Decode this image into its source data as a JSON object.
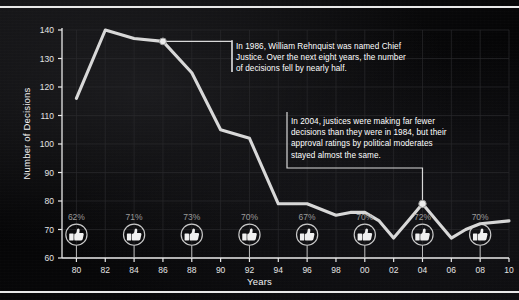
{
  "axes": {
    "ylabel": "Number of Decisions",
    "xlabel": "Years",
    "yticks": [
      "140",
      "130",
      "120",
      "110",
      "100",
      "90",
      "80",
      "70",
      "60"
    ],
    "xticks": [
      "80",
      "82",
      "84",
      "86",
      "88",
      "90",
      "92",
      "94",
      "96",
      "98",
      "00",
      "02",
      "04",
      "06",
      "08",
      "10"
    ]
  },
  "annotations": [
    {
      "name": "callout-1986",
      "text": "In 1986, William Rehnquist was named Chief\nJustice. Over the next eight years, the number\nof decisions fell by nearly half.",
      "marker_year": 1986,
      "marker_value": 136
    },
    {
      "name": "callout-2004",
      "text": "In 2004, justices were making far fewer\ndecisions than they were in 1984, but their\napproval ratings by political moderates\nstayed almost the same.",
      "marker_year": 2004,
      "marker_value": 79
    }
  ],
  "approval": [
    {
      "year": 1980,
      "label": "62%",
      "icon": "thumbs-up-icon"
    },
    {
      "year": 1984,
      "label": "71%",
      "icon": "thumbs-up-icon"
    },
    {
      "year": 1988,
      "label": "73%",
      "icon": "thumbs-up-icon"
    },
    {
      "year": 1992,
      "label": "70%",
      "icon": "thumbs-up-icon"
    },
    {
      "year": 1996,
      "label": "67%",
      "icon": "thumbs-up-icon"
    },
    {
      "year": 2000,
      "label": "70%",
      "icon": "thumbs-up-icon"
    },
    {
      "year": 2004,
      "label": "72%",
      "icon": "thumbs-up-icon"
    },
    {
      "year": 2008,
      "label": "70%",
      "icon": "thumbs-up-icon"
    }
  ],
  "colors": {
    "background": "#050506",
    "line": "#d8d8d8",
    "grid": "#2a2a2c",
    "axis": "#e9e9e9",
    "text": "#f2f2f2",
    "muted_text": "#9b9b9b",
    "marker_fill": "#ececec"
  },
  "chart_data": {
    "type": "line",
    "title": "",
    "xlabel": "Years",
    "ylabel": "Number of Decisions",
    "xlim": [
      1979,
      2010
    ],
    "ylim": [
      60,
      140
    ],
    "grid": true,
    "legend": "none",
    "x": [
      1980,
      1982,
      1984,
      1986,
      1988,
      1990,
      1992,
      1994,
      1996,
      1998,
      1999,
      2000,
      2001,
      2002,
      2003,
      2004,
      2005,
      2006,
      2007,
      2008,
      2010
    ],
    "values": [
      116,
      140,
      137,
      136,
      125,
      105,
      102,
      79,
      79,
      75,
      76,
      76,
      73,
      67,
      73,
      79,
      73,
      67,
      70,
      72,
      73
    ],
    "series": [
      {
        "name": "Number of Decisions",
        "values": [
          116,
          140,
          137,
          136,
          125,
          105,
          102,
          79,
          79,
          75,
          76,
          76,
          73,
          67,
          73,
          79,
          73,
          67,
          70,
          72,
          73
        ]
      }
    ],
    "secondary_series": {
      "name": "Approval rating by political moderates",
      "x": [
        1980,
        1984,
        1988,
        1992,
        1996,
        2000,
        2004,
        2008
      ],
      "labels": [
        "62%",
        "71%",
        "73%",
        "70%",
        "67%",
        "70%",
        "72%",
        "70%"
      ],
      "values": [
        62,
        71,
        73,
        70,
        67,
        70,
        72,
        70
      ]
    }
  }
}
